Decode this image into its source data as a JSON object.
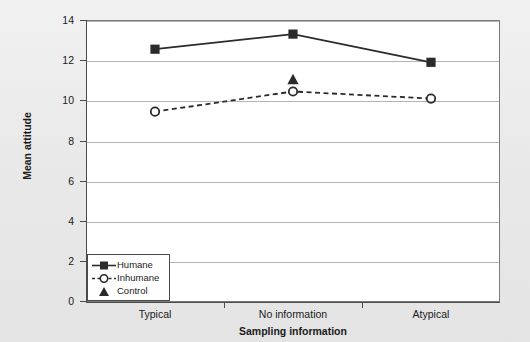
{
  "chart_data": {
    "type": "line",
    "title": "",
    "xlabel": "Sampling information",
    "ylabel": "Mean attitude",
    "categories": [
      "Typical",
      "No information",
      "Atypical"
    ],
    "ylim": [
      0,
      14
    ],
    "yticks": [
      0,
      2,
      4,
      6,
      8,
      10,
      12,
      14
    ],
    "ytick_labels": [
      "0",
      "2",
      "4",
      "6",
      "8",
      "10",
      "12",
      "14"
    ],
    "grid": "horizontal",
    "legend_position": "lower-left-inside",
    "series": [
      {
        "name": "Humane",
        "marker": "filled-square",
        "line": "solid",
        "color": "#2b2b2b",
        "values": [
          12.55,
          13.3,
          11.9
        ]
      },
      {
        "name": "Inhumane",
        "marker": "open-circle",
        "line": "dashed",
        "color": "#2b2b2b",
        "values": [
          9.45,
          10.45,
          10.1
        ]
      },
      {
        "name": "Control",
        "marker": "filled-triangle",
        "line": "none",
        "color": "#2b2b2b",
        "values": [
          null,
          11.05,
          null
        ]
      }
    ]
  },
  "axes": {
    "y_title": "Mean attitude",
    "x_title": "Sampling information",
    "y_ticks": [
      "14",
      "12",
      "10",
      "8",
      "6",
      "4",
      "2",
      "0"
    ],
    "x_categories": [
      "Typical",
      "No information",
      "Atypical"
    ]
  },
  "legend": {
    "items": [
      {
        "label": "Humane",
        "key": "square-solid-line-key"
      },
      {
        "label": "Inhumane",
        "key": "circle-dashed-line-key"
      },
      {
        "label": "Control",
        "key": "triangle-key"
      }
    ]
  },
  "colors": {
    "page_background": "#ececec",
    "plot_background": "#ffffff",
    "gridline": "#b4b4b4",
    "axis": "#4a4a4a",
    "series": "#2b2b2b",
    "text": "#1b1b1b"
  }
}
